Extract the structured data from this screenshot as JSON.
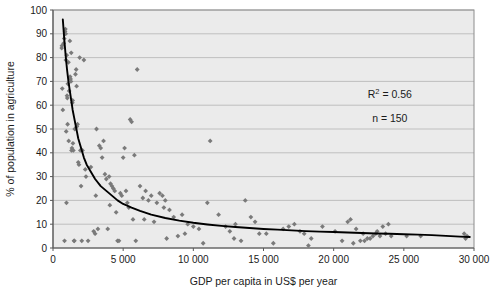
{
  "chart_data": {
    "type": "scatter",
    "title": "",
    "xlabel": "GDP per capita in US$ per year",
    "ylabel": "% of population in agriculture",
    "xlim": [
      0,
      30000
    ],
    "ylim": [
      0,
      100
    ],
    "xticks": [
      0,
      5000,
      10000,
      15000,
      20000,
      25000,
      30000
    ],
    "xticklabels": [
      "0",
      "5 000",
      "10 000",
      "15 000",
      "20 000",
      "25 000",
      "30 000"
    ],
    "yticks": [
      0,
      10,
      20,
      30,
      40,
      50,
      60,
      70,
      80,
      90,
      100
    ],
    "yticklabels": [
      "0",
      "10",
      "20",
      "30",
      "40",
      "50",
      "60",
      "70",
      "80",
      "90",
      "100"
    ],
    "grid": "horizontal",
    "legend": "none",
    "marker": "diamond",
    "marker_color": "#7a7a7a",
    "trendline_color": "#000000",
    "plot_background": "#ebebeb",
    "gridline_color": "#b4b4b4",
    "annotations": [
      {
        "id": "r-squared",
        "text_prefix": "R",
        "text_sup": "2",
        "text_suffix": " = 0.56",
        "x": 24000,
        "y": 63
      },
      {
        "id": "sample-size",
        "text": "n = 150",
        "x": 24000,
        "y": 53
      }
    ],
    "trendline": {
      "form": "power",
      "description": "fitted decreasing power curve",
      "points": [
        [
          700,
          96
        ],
        [
          800,
          88
        ],
        [
          900,
          81
        ],
        [
          1000,
          75
        ],
        [
          1100,
          70
        ],
        [
          1200,
          66
        ],
        [
          1300,
          62
        ],
        [
          1400,
          58
        ],
        [
          1500,
          55
        ],
        [
          1600,
          52
        ],
        [
          1700,
          49
        ],
        [
          1800,
          46
        ],
        [
          2000,
          42
        ],
        [
          2200,
          38
        ],
        [
          2400,
          35
        ],
        [
          2600,
          33
        ],
        [
          2800,
          31
        ],
        [
          3000,
          29
        ],
        [
          3400,
          26
        ],
        [
          3800,
          24
        ],
        [
          4200,
          22
        ],
        [
          4600,
          20
        ],
        [
          5000,
          18.5
        ],
        [
          5600,
          17
        ],
        [
          6200,
          15.6
        ],
        [
          7000,
          14
        ],
        [
          8000,
          12.6
        ],
        [
          9000,
          11.5
        ],
        [
          10000,
          10.6
        ],
        [
          11000,
          9.9
        ],
        [
          12000,
          9.3
        ],
        [
          13000,
          8.8
        ],
        [
          14000,
          8.4
        ],
        [
          15000,
          8.0
        ],
        [
          16000,
          7.7
        ],
        [
          17000,
          7.4
        ],
        [
          18000,
          7.1
        ],
        [
          19000,
          6.9
        ],
        [
          20000,
          6.7
        ],
        [
          21000,
          6.5
        ],
        [
          22000,
          6.3
        ],
        [
          23000,
          6.1
        ],
        [
          24000,
          6.0
        ],
        [
          25000,
          5.8
        ],
        [
          26000,
          5.6
        ],
        [
          27000,
          5.4
        ],
        [
          28000,
          5.1
        ],
        [
          29000,
          4.8
        ],
        [
          29700,
          4.6
        ]
      ]
    },
    "points": [
      [
        620,
        84
      ],
      [
        640,
        85
      ],
      [
        660,
        67
      ],
      [
        700,
        58
      ],
      [
        760,
        86
      ],
      [
        800,
        88
      ],
      [
        820,
        3
      ],
      [
        860,
        91
      ],
      [
        880,
        92
      ],
      [
        900,
        90
      ],
      [
        920,
        79
      ],
      [
        940,
        49
      ],
      [
        960,
        19
      ],
      [
        980,
        81
      ],
      [
        1000,
        64
      ],
      [
        1020,
        63
      ],
      [
        1040,
        52
      ],
      [
        1060,
        69
      ],
      [
        1100,
        78
      ],
      [
        1150,
        66
      ],
      [
        1200,
        87
      ],
      [
        1220,
        72
      ],
      [
        1250,
        71
      ],
      [
        1280,
        70
      ],
      [
        1300,
        82
      ],
      [
        1320,
        41
      ],
      [
        1350,
        42
      ],
      [
        1380,
        61
      ],
      [
        1400,
        62
      ],
      [
        1450,
        41
      ],
      [
        1500,
        3
      ],
      [
        1520,
        3
      ],
      [
        1550,
        50
      ],
      [
        1600,
        73
      ],
      [
        1650,
        75
      ],
      [
        1680,
        68
      ],
      [
        1700,
        51
      ],
      [
        1750,
        52
      ],
      [
        1800,
        36
      ],
      [
        1850,
        35
      ],
      [
        1900,
        80
      ],
      [
        1950,
        41
      ],
      [
        2000,
        26
      ],
      [
        2050,
        3
      ],
      [
        2100,
        41
      ],
      [
        2200,
        79
      ],
      [
        2300,
        33
      ],
      [
        2500,
        3
      ],
      [
        2700,
        34
      ],
      [
        2900,
        7
      ],
      [
        3000,
        6
      ],
      [
        3100,
        50
      ],
      [
        3200,
        8
      ],
      [
        3300,
        43
      ],
      [
        3400,
        42
      ],
      [
        3500,
        38
      ],
      [
        3600,
        45
      ],
      [
        3700,
        31
      ],
      [
        3800,
        29
      ],
      [
        3900,
        8
      ],
      [
        4000,
        30
      ],
      [
        4100,
        27
      ],
      [
        4200,
        26
      ],
      [
        4300,
        25
      ],
      [
        4400,
        24
      ],
      [
        4500,
        15
      ],
      [
        4600,
        3
      ],
      [
        4700,
        3
      ],
      [
        4800,
        23
      ],
      [
        4900,
        22
      ],
      [
        5000,
        38
      ],
      [
        5100,
        42
      ],
      [
        5200,
        24
      ],
      [
        5300,
        19
      ],
      [
        5400,
        17
      ],
      [
        5500,
        54
      ],
      [
        5600,
        53
      ],
      [
        5700,
        12
      ],
      [
        5800,
        39
      ],
      [
        5900,
        3
      ],
      [
        6000,
        75
      ],
      [
        6200,
        26
      ],
      [
        6400,
        21
      ],
      [
        6600,
        24
      ],
      [
        6800,
        20
      ],
      [
        7000,
        22
      ],
      [
        7200,
        11
      ],
      [
        7400,
        19
      ],
      [
        7600,
        23
      ],
      [
        7800,
        22
      ],
      [
        7900,
        17
      ],
      [
        8000,
        20
      ],
      [
        8100,
        4
      ],
      [
        8300,
        16
      ],
      [
        8600,
        13
      ],
      [
        8900,
        5
      ],
      [
        9200,
        14
      ],
      [
        9600,
        10
      ],
      [
        10000,
        9
      ],
      [
        10400,
        8
      ],
      [
        10700,
        2
      ],
      [
        11000,
        19
      ],
      [
        11200,
        45
      ],
      [
        11800,
        14
      ],
      [
        12300,
        9
      ],
      [
        12600,
        7
      ],
      [
        13000,
        10
      ],
      [
        13400,
        3
      ],
      [
        13700,
        20
      ],
      [
        14100,
        13
      ],
      [
        14400,
        11
      ],
      [
        14700,
        6
      ],
      [
        15200,
        6
      ],
      [
        15700,
        2
      ],
      [
        16400,
        8
      ],
      [
        16800,
        9
      ],
      [
        17200,
        10
      ],
      [
        17600,
        7
      ],
      [
        18200,
        1
      ],
      [
        18400,
        4
      ],
      [
        19200,
        9
      ],
      [
        20100,
        7
      ],
      [
        20600,
        3
      ],
      [
        21000,
        11
      ],
      [
        21200,
        12
      ],
      [
        21400,
        2
      ],
      [
        21600,
        8
      ],
      [
        21900,
        3
      ],
      [
        22100,
        6
      ],
      [
        22400,
        4
      ],
      [
        22600,
        4
      ],
      [
        22800,
        5
      ],
      [
        23000,
        6
      ],
      [
        23100,
        7
      ],
      [
        23300,
        5
      ],
      [
        23500,
        9
      ],
      [
        23700,
        6
      ],
      [
        23900,
        10
      ],
      [
        24100,
        5
      ],
      [
        25200,
        5
      ],
      [
        26200,
        5
      ],
      [
        29300,
        6
      ],
      [
        29400,
        4
      ],
      [
        29500,
        5
      ],
      [
        1120,
        45
      ],
      [
        1420,
        44
      ],
      [
        2350,
        30
      ],
      [
        3050,
        22
      ],
      [
        4050,
        18
      ],
      [
        6500,
        12
      ],
      [
        9400,
        6
      ],
      [
        12900,
        4
      ],
      [
        17900,
        6
      ],
      [
        22200,
        3
      ]
    ]
  }
}
